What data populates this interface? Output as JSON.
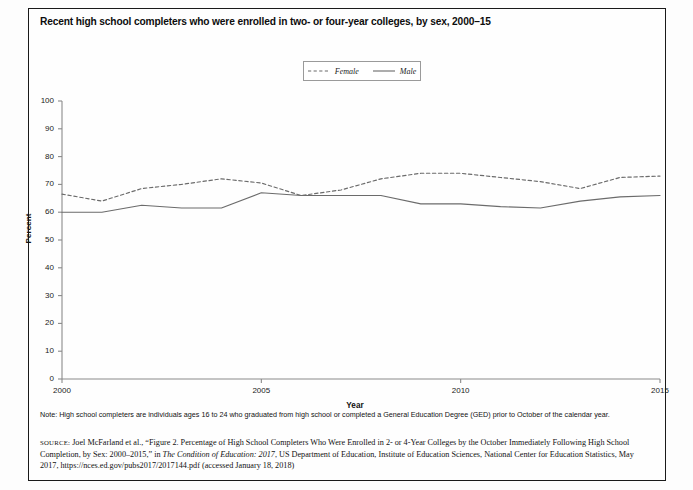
{
  "figure": {
    "title": "Recent high school completers who were enrolled in two- or four-year colleges, by sex, 2000–15",
    "note": "Note: High school completers are individuals ages 16 to 24 who graduated from high school or completed a General Education Degree (GED) prior to October of the calendar year.",
    "source_label": "source:",
    "source_part1": " Joel McFarland et al., “Figure 2. Percentage of High School Completers Who Were Enrolled in 2- or 4-Year Colleges by the October Immediately Following High School Completion, by Sex: 2000–2015,” in ",
    "source_italic": "The Condition of Education: 2017",
    "source_part2": ", US Department of Education, Institute of Education Sciences, National Center for Education Statistics, May 2017, https://nces.ed.gov/pubs2017/2017144.pdf (accessed January 18, 2018)"
  },
  "colors": {
    "female_line": "#6b6b6b",
    "male_line": "#6b6b6b",
    "axis": "#8a8a8a",
    "frame": "#1a1a1a",
    "text": "#121212"
  },
  "legend": {
    "position": "top-center",
    "entries": [
      {
        "label": "Female",
        "style": "dashed",
        "icon": "dashed-line-swatch"
      },
      {
        "label": "Male",
        "style": "solid",
        "icon": "solid-line-swatch"
      }
    ]
  },
  "chart_data": {
    "type": "line",
    "title": "Recent high school completers who were enrolled in two- or four-year colleges, by sex, 2000–15",
    "xlabel": "Year",
    "ylabel": "Percent",
    "xlim": [
      2000,
      2015
    ],
    "ylim": [
      0,
      100
    ],
    "grid": false,
    "x": [
      2000,
      2001,
      2002,
      2003,
      2004,
      2005,
      2006,
      2007,
      2008,
      2009,
      2010,
      2011,
      2012,
      2013,
      2014,
      2015
    ],
    "xticks": [
      2000,
      2005,
      2010,
      2015
    ],
    "xtick_labels": [
      "2000",
      "2005",
      "2010",
      "2015"
    ],
    "yticks": [
      0,
      10,
      20,
      30,
      40,
      50,
      60,
      70,
      80,
      90,
      100
    ],
    "ytick_labels": [
      "0",
      "10",
      "20",
      "30",
      "40",
      "50",
      "60",
      "70",
      "80",
      "90",
      "100"
    ],
    "series": [
      {
        "name": "Female",
        "style": "dashed",
        "values": [
          66.5,
          64.0,
          68.5,
          70.0,
          72.0,
          70.5,
          66.0,
          68.0,
          72.0,
          74.0,
          74.0,
          72.5,
          71.0,
          68.5,
          72.5,
          73.0
        ]
      },
      {
        "name": "Male",
        "style": "solid",
        "values": [
          60.0,
          60.0,
          62.5,
          61.5,
          61.5,
          67.0,
          66.0,
          66.0,
          66.0,
          63.0,
          63.0,
          62.0,
          61.5,
          64.0,
          65.5,
          66.0
        ]
      }
    ]
  }
}
